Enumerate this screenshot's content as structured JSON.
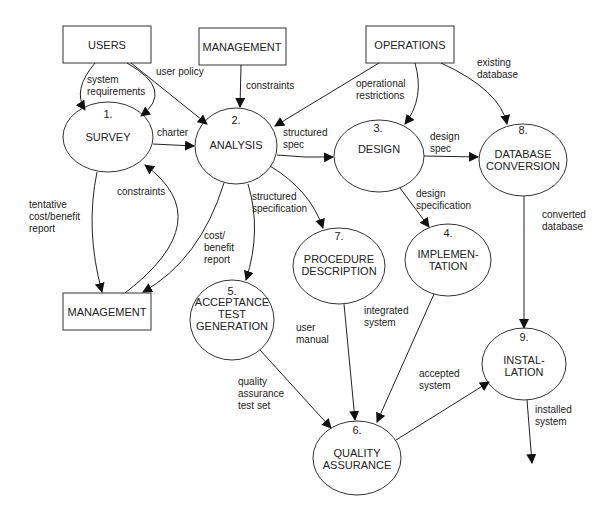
{
  "diagram": {
    "type": "data-flow-diagram",
    "externals": {
      "users": "USERS",
      "management_top": "MANAGEMENT",
      "operations": "OPERATIONS",
      "management_bottom": "MANAGEMENT"
    },
    "processes": {
      "p1": {
        "num": "1.",
        "line1": "SURVEY",
        "line2": ""
      },
      "p2": {
        "num": "2.",
        "line1": "ANALYSIS",
        "line2": ""
      },
      "p3": {
        "num": "3.",
        "line1": "DESIGN",
        "line2": ""
      },
      "p4": {
        "num": "4.",
        "line1": "IMPLEMEN-",
        "line2": "TATION"
      },
      "p5": {
        "num": "5.",
        "line1": "ACCEPTANCE",
        "line2": "TEST",
        "line3": "GENERATION"
      },
      "p6": {
        "num": "6.",
        "line1": "QUALITY",
        "line2": "ASSURANCE"
      },
      "p7": {
        "num": "7.",
        "line1": "PROCEDURE",
        "line2": "DESCRIPTION"
      },
      "p8": {
        "num": "8.",
        "line1": "DATABASE",
        "line2": "CONVERSION"
      },
      "p9": {
        "num": "9.",
        "line1": "INSTAL-",
        "line2": "LATION"
      }
    },
    "flows": {
      "system_requirements": [
        "system",
        "requirements"
      ],
      "user_policy": [
        "user policy"
      ],
      "constraints_mgmt": [
        "constraints"
      ],
      "operational_restrictions": [
        "operational",
        "restrictions"
      ],
      "existing_database": [
        "existing",
        "database"
      ],
      "charter": [
        "charter"
      ],
      "structured_spec": [
        "structured",
        "spec"
      ],
      "design_spec": [
        "design",
        "spec"
      ],
      "constraints_back": [
        "constraints"
      ],
      "tentative_report": [
        "tentative",
        "cost/benefit",
        "report"
      ],
      "cost_benefit_report": [
        "cost/",
        "benefit",
        "report"
      ],
      "structured_specification": [
        "structured",
        "specification"
      ],
      "design_specification": [
        "design",
        "specification"
      ],
      "converted_database": [
        "converted",
        "database"
      ],
      "integrated_system": [
        "integrated",
        "system"
      ],
      "user_manual": [
        "user",
        "manual"
      ],
      "qa_test_set": [
        "quality",
        "assurance",
        "test set"
      ],
      "accepted_system": [
        "accepted",
        "system"
      ],
      "installed_system": [
        "installed",
        "system"
      ]
    }
  }
}
